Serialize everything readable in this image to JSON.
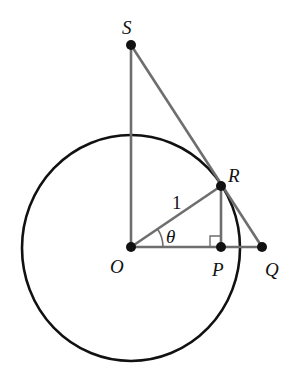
{
  "diagram": {
    "colors": {
      "circle": "#111111",
      "segments": "#6e6e6e",
      "points": "#111111",
      "labels": "#111111"
    },
    "circle": {
      "cx": 131,
      "cy": 248,
      "rx": 109,
      "ry": 113
    },
    "points": {
      "S": {
        "x": 131,
        "y": 45,
        "label": "S"
      },
      "R": {
        "x": 221,
        "y": 186,
        "label": "R"
      },
      "O": {
        "x": 131,
        "y": 247,
        "label": "O"
      },
      "P": {
        "x": 221,
        "y": 247,
        "label": "P"
      },
      "Q": {
        "x": 262,
        "y": 247,
        "label": "Q"
      }
    },
    "radius_label": "1",
    "angle_label": "θ",
    "right_angle_at": "P"
  }
}
